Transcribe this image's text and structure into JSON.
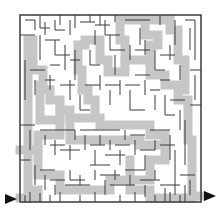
{
  "puzzle": {
    "type": "maze",
    "entry_arrow": {
      "x": 10,
      "y": 199,
      "direction": "right"
    },
    "exit_arrow": {
      "x": 210,
      "y": 196,
      "direction": "right"
    },
    "bounds": {
      "left": 20,
      "top": 15,
      "right": 201,
      "bottom": 202
    },
    "colors": {
      "background": "#ffffff",
      "wall": "#333333",
      "solution_path": "#c8c8c8",
      "arrow": "#111111"
    },
    "solution_path_points": [
      [
        20,
        198
      ],
      [
        40,
        198
      ],
      [
        40,
        188
      ],
      [
        30,
        188
      ],
      [
        30,
        140
      ],
      [
        30,
        120
      ],
      [
        25,
        100
      ],
      [
        25,
        35
      ],
      [
        35,
        35
      ],
      [
        35,
        65
      ],
      [
        45,
        70
      ],
      [
        45,
        90
      ],
      [
        55,
        95
      ],
      [
        65,
        110
      ],
      [
        80,
        115
      ],
      [
        90,
        115
      ],
      [
        95,
        110
      ],
      [
        95,
        100
      ],
      [
        100,
        95
      ],
      [
        90,
        80
      ],
      [
        85,
        60
      ],
      [
        80,
        45
      ],
      [
        85,
        40
      ],
      [
        100,
        45
      ],
      [
        105,
        60
      ],
      [
        110,
        70
      ],
      [
        125,
        75
      ],
      [
        135,
        70
      ],
      [
        145,
        65
      ],
      [
        155,
        75
      ],
      [
        165,
        80
      ],
      [
        175,
        90
      ],
      [
        185,
        100
      ],
      [
        185,
        120
      ],
      [
        190,
        140
      ],
      [
        195,
        170
      ],
      [
        195,
        196
      ],
      [
        201,
        196
      ]
    ]
  }
}
